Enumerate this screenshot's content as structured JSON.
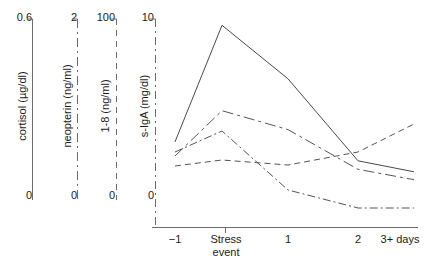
{
  "chart_data": {
    "type": "line",
    "title": "",
    "xlabel": "",
    "ylabel": "",
    "grid": false,
    "legend_position": "none",
    "categories": [
      "−1",
      "Stress event",
      "1",
      "2",
      "3+ days"
    ],
    "x_tick_labels": [
      "−1",
      "Stress",
      "event",
      "1",
      "2",
      "3+ days"
    ],
    "axes": [
      {
        "name": "cortisol",
        "title": "cortisol (µg/dl)",
        "top_tick": "0.6",
        "bottom_tick": "0",
        "ylim": [
          0,
          0.6
        ],
        "line_style": "solid",
        "color": "#555555"
      },
      {
        "name": "neopterin",
        "title": "neopterin (ng/ml)",
        "top_tick": "2",
        "bottom_tick": "0",
        "ylim": [
          0,
          2
        ],
        "line_style": "dashdot-long",
        "color": "#555555"
      },
      {
        "name": "i-8",
        "title": "1-8 (ng/ml)",
        "top_tick": "100",
        "bottom_tick": "0",
        "ylim": [
          0,
          100
        ],
        "line_style": "dashed",
        "color": "#555555"
      },
      {
        "name": "s-IgA",
        "title": "s-IgA (mg/dl)",
        "top_tick": "10",
        "bottom_tick": "0",
        "ylim": [
          0,
          10
        ],
        "line_style": "dashdot",
        "color": "#555555"
      }
    ],
    "series": [
      {
        "name": "cortisol",
        "line_style": "solid",
        "axis": "cortisol",
        "units": "µg/dl",
        "values": [
          0.21,
          0.58,
          0.41,
          0.15,
          0.115
        ]
      },
      {
        "name": "neopterin",
        "line_style": "dashdot-long",
        "axis": "neopterin",
        "units": "ng/ml",
        "values": [
          0.55,
          1.03,
          0.83,
          0.41,
          0.3
        ]
      },
      {
        "name": "1-8",
        "line_style": "dashed",
        "axis": "1-8",
        "units": "ng/ml",
        "values": [
          29,
          34,
          31,
          38,
          54
        ]
      },
      {
        "name": "s-IgA",
        "line_style": "dashdot",
        "axis": "s-IgA",
        "units": "mg/dl",
        "values": [
          3.9,
          4.3,
          1.3,
          0.65,
          0.65
        ]
      }
    ]
  },
  "axis_labels": {
    "cortisol_top": "0.6",
    "cortisol_bottom": "0",
    "cortisol_title": "cortisol (µg/dl)",
    "neopterin_top": "2",
    "neopterin_bottom": "0",
    "neopterin_title": "neopterin (ng/ml)",
    "i8_top": "100",
    "i8_bottom": "0",
    "i8_title": "1-8 (ng/ml)",
    "siga_top": "10",
    "siga_bottom": "0",
    "siga_title": "s-IgA (mg/dl)"
  },
  "x_axis": {
    "tick_minus1": "−1",
    "tick_stress_line1": "Stress",
    "tick_stress_line2": "event",
    "tick_1": "1",
    "tick_2": "2",
    "tick_3plus": "3+ days"
  }
}
